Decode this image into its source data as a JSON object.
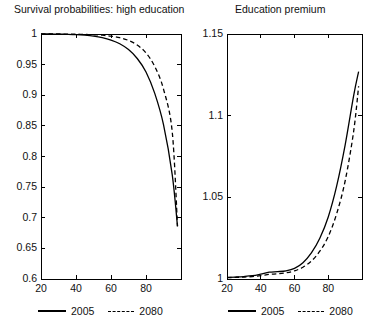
{
  "figure": {
    "background": "#ffffff",
    "line_color": "#000000",
    "axis_color": "#000000"
  },
  "panels": [
    {
      "id": "survival",
      "title": "Survival probabilities: high education",
      "legend": [
        {
          "label": "2005",
          "style": "solid"
        },
        {
          "label": "2080",
          "style": "dashed"
        }
      ]
    },
    {
      "id": "premium",
      "title": "Education premium",
      "legend": [
        {
          "label": "2005",
          "style": "solid"
        },
        {
          "label": "2080",
          "style": "dashed"
        }
      ]
    }
  ],
  "chart_data": [
    {
      "type": "line",
      "title": "Survival probabilities: high education",
      "xlabel": "",
      "ylabel": "",
      "xlim": [
        20,
        100
      ],
      "ylim": [
        0.6,
        1.0
      ],
      "xticks": [
        20,
        40,
        60,
        80
      ],
      "yticks": [
        0.6,
        0.65,
        0.7,
        0.75,
        0.8,
        0.85,
        0.9,
        0.95,
        1
      ],
      "ytick_labels": [
        "0.6",
        "0.65",
        "0.7",
        "0.75",
        "0.8",
        "0.85",
        "0.9",
        "0.95",
        "1"
      ],
      "xtick_labels": [
        "20",
        "40",
        "60",
        "80"
      ],
      "grid": false,
      "legend_position": "below",
      "x": [
        20,
        25,
        30,
        35,
        40,
        45,
        50,
        55,
        60,
        65,
        70,
        75,
        80,
        85,
        90,
        95,
        98
      ],
      "series": [
        {
          "name": "2005",
          "style": "solid",
          "values": [
            1.0,
            1.0,
            0.9998,
            0.9995,
            0.999,
            0.998,
            0.9965,
            0.994,
            0.99,
            0.984,
            0.9745,
            0.96,
            0.938,
            0.903,
            0.852,
            0.77,
            0.686
          ]
        },
        {
          "name": "2080",
          "style": "dashed",
          "values": [
            1.0,
            1.0,
            1.0,
            0.9999,
            0.9997,
            0.9993,
            0.9988,
            0.998,
            0.9965,
            0.994,
            0.9895,
            0.982,
            0.969,
            0.947,
            0.91,
            0.84,
            0.686
          ]
        }
      ]
    },
    {
      "type": "line",
      "title": "Education premium",
      "xlabel": "",
      "ylabel": "",
      "xlim": [
        20,
        100
      ],
      "ylim": [
        1.0,
        1.15
      ],
      "xticks": [
        20,
        40,
        60,
        80
      ],
      "yticks": [
        1.0,
        1.05,
        1.1,
        1.15
      ],
      "ytick_labels": [
        "1",
        "1.05",
        "1.1",
        "1.15"
      ],
      "xtick_labels": [
        "20",
        "40",
        "60",
        "80"
      ],
      "grid": false,
      "legend_position": "below",
      "x": [
        20,
        25,
        30,
        35,
        40,
        45,
        50,
        55,
        60,
        65,
        70,
        75,
        80,
        85,
        90,
        95,
        98
      ],
      "series": [
        {
          "name": "2005",
          "style": "solid",
          "values": [
            1.001,
            1.0012,
            1.0015,
            1.002,
            1.003,
            1.0042,
            1.0045,
            1.005,
            1.0065,
            1.01,
            1.016,
            1.025,
            1.038,
            1.057,
            1.082,
            1.112,
            1.127
          ]
        },
        {
          "name": "2080",
          "style": "dashed",
          "values": [
            1.0008,
            1.001,
            1.0012,
            1.0015,
            1.002,
            1.0028,
            1.0032,
            1.0038,
            1.005,
            1.0072,
            1.011,
            1.017,
            1.026,
            1.04,
            1.06,
            1.09,
            1.118
          ]
        }
      ]
    }
  ]
}
